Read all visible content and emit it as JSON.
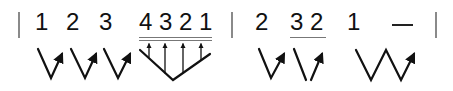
{
  "notation": {
    "type": "jianpu",
    "measures": [
      {
        "notes": [
          {
            "label": "1"
          },
          {
            "label": "2"
          },
          {
            "label": "3"
          },
          {
            "label": "4 3 2 1",
            "underline": "double"
          }
        ]
      },
      {
        "notes": [
          {
            "label": "2"
          },
          {
            "label": "3 2",
            "underline": "single"
          },
          {
            "label": "1"
          },
          {
            "label": "—"
          }
        ]
      }
    ],
    "gestures": [
      "check-arrow",
      "check-arrow",
      "check-arrow",
      "fan-arrows",
      "check-arrow",
      "slash-check-arrow",
      "w-arrow"
    ]
  },
  "colors": {
    "ink": "#111111",
    "barline": "#8a8a8a",
    "underline": "#777777"
  }
}
